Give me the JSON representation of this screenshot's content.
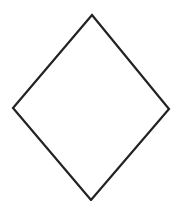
{
  "diagram": {
    "shape": "diamond",
    "vertices": {
      "top": [
        92,
        15
      ],
      "right": [
        169,
        109
      ],
      "bottom": [
        91,
        200
      ],
      "left": [
        13,
        108
      ]
    },
    "stroke_color": "#222222",
    "stroke_width": 2.2,
    "fill_color": "#ffffff",
    "background_color": "#ffffff"
  }
}
